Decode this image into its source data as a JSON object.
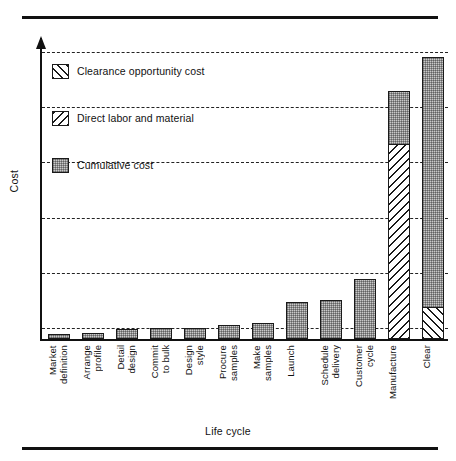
{
  "chart_data": {
    "type": "bar",
    "title": "",
    "xlabel": "Life cycle",
    "ylabel": "Cost",
    "grid": true,
    "gridlines": 6,
    "ylim": [
      0,
      6.3
    ],
    "legend_position": "upper-left",
    "categories": [
      "Market\ndefinition",
      "Arrange\nprofile",
      "Detail\ndesign",
      "Commit\nto bulk",
      "Design\nstyle",
      "Procure\nsamples",
      "Make\nsamples",
      "Launch",
      "Schedule\ndelivery",
      "Customer\ncycle",
      "Manufacture",
      "Clear"
    ],
    "series": [
      {
        "name": "Cumulative cost",
        "pattern": "stipple-gray",
        "values": [
          0.1,
          0.12,
          0.2,
          0.22,
          0.22,
          0.3,
          0.34,
          0.78,
          0.82,
          1.25,
          1.1,
          5.25
        ]
      },
      {
        "name": "Direct labor and material",
        "pattern": "backslash-hatch",
        "values": [
          0,
          0,
          0,
          0,
          0,
          0,
          0,
          0,
          0,
          0,
          4.05,
          0
        ]
      },
      {
        "name": "Clearance opportunity cost",
        "pattern": "forwardslash-hatch",
        "values": [
          0,
          0,
          0,
          0,
          0,
          0,
          0,
          0,
          0,
          0,
          0,
          0.62
        ]
      }
    ]
  },
  "legend": {
    "items": [
      {
        "label": "Clearance opportunity cost",
        "pattern": "forwardslash-hatch"
      },
      {
        "label": "Direct labor and material",
        "pattern": "backslash-hatch"
      },
      {
        "label": "Cumulative cost",
        "pattern": "stipple-gray"
      }
    ]
  },
  "colors": {
    "cumulative_fill": "#c9c9c9",
    "hatch_line": "#1a1a1a",
    "axis": "#111111",
    "gridline": "#222222",
    "background": "#ffffff"
  }
}
